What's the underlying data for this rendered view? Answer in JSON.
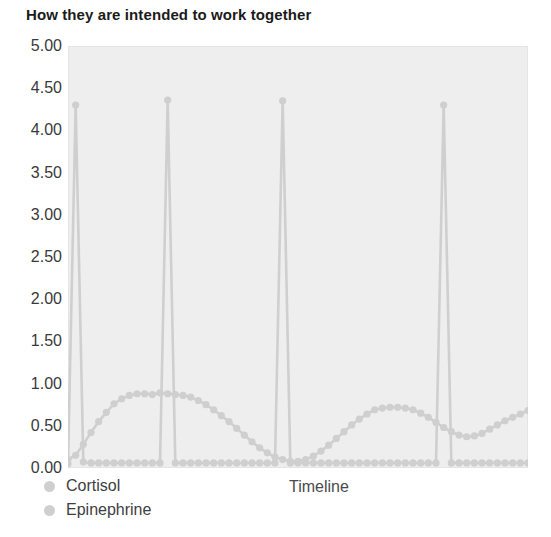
{
  "chart_data": {
    "type": "line",
    "title": "How they are intended to work together",
    "xlabel": "Timeline",
    "ylabel": "",
    "ylim": [
      0,
      5
    ],
    "ytick_labels": [
      "5.00",
      "4.50",
      "4.00",
      "3.50",
      "3.00",
      "2.50",
      "2.00",
      "1.50",
      "1.00",
      "0.50",
      "0.00"
    ],
    "ytick_values": [
      5.0,
      4.5,
      4.0,
      3.5,
      3.0,
      2.5,
      2.0,
      1.5,
      1.0,
      0.5,
      0.0
    ],
    "xtick_labels": [],
    "grid": false,
    "legend_position": "bottom-left",
    "plot_background": "#eeeeee",
    "series": [
      {
        "name": "Cortisol",
        "color": "#cfcfcf",
        "values": [
          0.1,
          0.15,
          0.28,
          0.42,
          0.55,
          0.66,
          0.76,
          0.82,
          0.86,
          0.88,
          0.88,
          0.87,
          0.89,
          0.88,
          0.87,
          0.86,
          0.84,
          0.8,
          0.75,
          0.69,
          0.62,
          0.55,
          0.47,
          0.39,
          0.31,
          0.24,
          0.18,
          0.13,
          0.1,
          0.08,
          0.08,
          0.1,
          0.14,
          0.2,
          0.27,
          0.35,
          0.43,
          0.51,
          0.58,
          0.64,
          0.69,
          0.71,
          0.72,
          0.72,
          0.71,
          0.69,
          0.65,
          0.6,
          0.54,
          0.48,
          0.43,
          0.39,
          0.37,
          0.38,
          0.41,
          0.46,
          0.51,
          0.56,
          0.6,
          0.64,
          0.68
        ]
      },
      {
        "name": "Epinephrine",
        "color": "#cfcfcf",
        "values": [
          0.05,
          4.3,
          0.07,
          0.06,
          0.06,
          0.06,
          0.06,
          0.06,
          0.06,
          0.06,
          0.06,
          0.06,
          0.06,
          4.36,
          0.06,
          0.06,
          0.06,
          0.06,
          0.06,
          0.06,
          0.06,
          0.06,
          0.06,
          0.06,
          0.06,
          0.06,
          0.06,
          0.06,
          4.35,
          0.06,
          0.06,
          0.06,
          0.06,
          0.06,
          0.06,
          0.06,
          0.06,
          0.06,
          0.06,
          0.06,
          0.06,
          0.06,
          0.06,
          0.06,
          0.06,
          0.06,
          0.06,
          0.06,
          0.06,
          4.3,
          0.06,
          0.06,
          0.06,
          0.06,
          0.06,
          0.06,
          0.06,
          0.06,
          0.06,
          0.06,
          0.06
        ]
      }
    ]
  },
  "legend": {
    "items": [
      {
        "label": "Cortisol"
      },
      {
        "label": "Epinephrine"
      }
    ]
  }
}
